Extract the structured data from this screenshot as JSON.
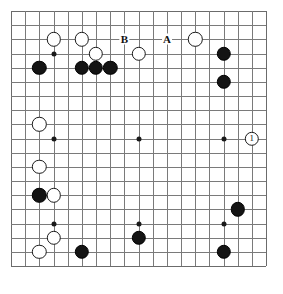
{
  "board": {
    "size": 19,
    "origin_x": 11,
    "origin_y": 11,
    "spacing": 14.17,
    "line_color": "#7a7a7a",
    "edge_color": "#6b6b6b",
    "background": "#ffffff",
    "stone_radius": 7.2,
    "star_points": [
      {
        "col": 3,
        "row": 3
      },
      {
        "col": 9,
        "row": 3
      },
      {
        "col": 15,
        "row": 3
      },
      {
        "col": 3,
        "row": 9
      },
      {
        "col": 9,
        "row": 9
      },
      {
        "col": 15,
        "row": 9
      },
      {
        "col": 3,
        "row": 15
      },
      {
        "col": 9,
        "row": 15
      },
      {
        "col": 15,
        "row": 15
      }
    ],
    "stones": [
      {
        "col": 3,
        "row": 2,
        "color": "white",
        "label": ""
      },
      {
        "col": 5,
        "row": 2,
        "color": "white",
        "label": ""
      },
      {
        "col": 6,
        "row": 3,
        "color": "white",
        "label": ""
      },
      {
        "col": 9,
        "row": 3,
        "color": "white",
        "label": ""
      },
      {
        "col": 13,
        "row": 2,
        "color": "white",
        "label": ""
      },
      {
        "col": 2,
        "row": 4,
        "color": "black",
        "label": ""
      },
      {
        "col": 5,
        "row": 4,
        "color": "black",
        "label": ""
      },
      {
        "col": 6,
        "row": 4,
        "color": "black",
        "label": ""
      },
      {
        "col": 7,
        "row": 4,
        "color": "black",
        "label": ""
      },
      {
        "col": 15,
        "row": 3,
        "color": "black",
        "label": ""
      },
      {
        "col": 15,
        "row": 5,
        "color": "black",
        "label": ""
      },
      {
        "col": 2,
        "row": 8,
        "color": "white",
        "label": ""
      },
      {
        "col": 17,
        "row": 9,
        "color": "white",
        "label": "1"
      },
      {
        "col": 2,
        "row": 11,
        "color": "white",
        "label": ""
      },
      {
        "col": 2,
        "row": 13,
        "color": "black",
        "label": ""
      },
      {
        "col": 3,
        "row": 13,
        "color": "white",
        "label": ""
      },
      {
        "col": 16,
        "row": 14,
        "color": "black",
        "label": ""
      },
      {
        "col": 3,
        "row": 16,
        "color": "white",
        "label": ""
      },
      {
        "col": 9,
        "row": 16,
        "color": "black",
        "label": ""
      },
      {
        "col": 2,
        "row": 17,
        "color": "white",
        "label": ""
      },
      {
        "col": 5,
        "row": 17,
        "color": "black",
        "label": ""
      },
      {
        "col": 15,
        "row": 17,
        "color": "black",
        "label": ""
      }
    ],
    "markers": [
      {
        "col": 8,
        "row": 2,
        "text": "B"
      },
      {
        "col": 11,
        "row": 2,
        "text": "A"
      }
    ]
  }
}
